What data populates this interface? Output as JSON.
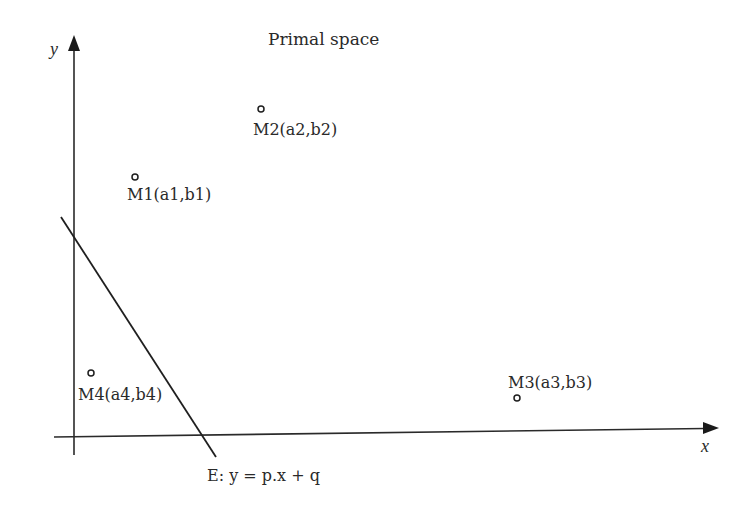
{
  "title": "Primal space",
  "axes": {
    "x_label": "x",
    "y_label": "y"
  },
  "line": {
    "label": "E: y = p.x + q",
    "start": [
      61,
      217
    ],
    "end": [
      216,
      457
    ]
  },
  "points": [
    {
      "id": "M1",
      "label": "M1(a1,b1)",
      "cx": 135,
      "cy": 177,
      "tx": 127,
      "ty": 200
    },
    {
      "id": "M2",
      "label": "M2(a2,b2)",
      "cx": 261,
      "cy": 109,
      "tx": 253,
      "ty": 135
    },
    {
      "id": "M3",
      "label": "M3(a3,b3)",
      "cx": 517,
      "cy": 398,
      "tx": 508,
      "ty": 388
    },
    {
      "id": "M4",
      "label": "M4(a4,b4)",
      "cx": 91,
      "cy": 373,
      "tx": 78,
      "ty": 400
    }
  ],
  "colors": {
    "ink": "#2a2a2a",
    "background": "#ffffff"
  }
}
